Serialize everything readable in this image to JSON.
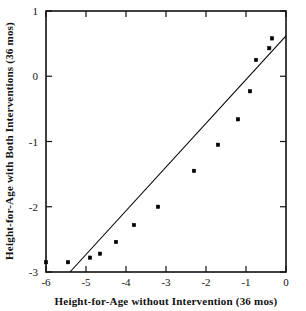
{
  "chart_data": {
    "type": "scatter",
    "title": "",
    "xlabel": "Height-for-Age without Intervention (36 mos)",
    "ylabel": "Height-for-Age with Both Interventions (36 mos)",
    "xlim": [
      -6,
      0
    ],
    "ylim": [
      -3,
      1
    ],
    "xticks": [
      -6,
      -5,
      -4,
      -3,
      -2,
      -1,
      0
    ],
    "xtick_labels": [
      "-6",
      "-5",
      "-4",
      "-3",
      "-2",
      "-1",
      "0"
    ],
    "yticks": [
      -3,
      -2,
      -1,
      0,
      1
    ],
    "ytick_labels": [
      "-3",
      "-2",
      "-1",
      "0",
      "1"
    ],
    "grid": false,
    "legend": null,
    "marker": "square",
    "marker_color": "#000000",
    "series": [
      {
        "name": "observations",
        "points": [
          [
            -6.0,
            -2.85
          ],
          [
            -5.45,
            -2.85
          ],
          [
            -4.9,
            -2.78
          ],
          [
            -4.65,
            -2.72
          ],
          [
            -4.25,
            -2.54
          ],
          [
            -3.8,
            -2.28
          ],
          [
            -3.2,
            -2.0
          ],
          [
            -2.3,
            -1.45
          ],
          [
            -1.7,
            -1.05
          ],
          [
            -1.2,
            -0.66
          ],
          [
            -0.9,
            -0.23
          ],
          [
            -0.75,
            0.25
          ],
          [
            -0.42,
            0.43
          ],
          [
            -0.35,
            0.58
          ]
        ]
      }
    ],
    "reference_line": {
      "name": "identity-line",
      "x0": -5.4,
      "y0": -3.0,
      "x1": 0.0,
      "y1": 0.62,
      "color": "#000000"
    }
  }
}
